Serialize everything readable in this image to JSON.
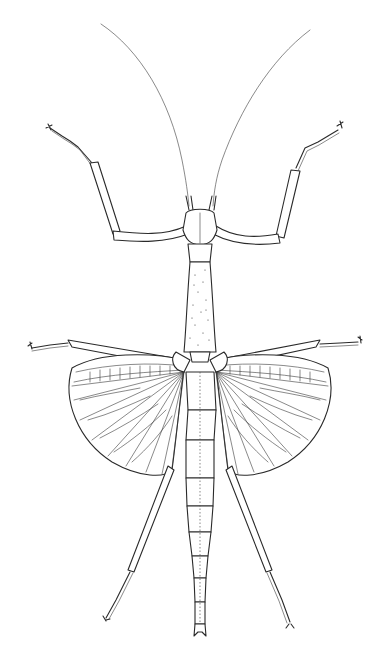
{
  "image": {
    "subject": "stick-insect-line-drawing",
    "background": "#ffffff",
    "ink": "#2a2a2a",
    "width": 385,
    "height": 659
  },
  "parts": {
    "antennae": 2,
    "forelegs": 2,
    "midlegs": 2,
    "hindlegs": 2,
    "wings": 2,
    "abdomen_segments": 9
  }
}
